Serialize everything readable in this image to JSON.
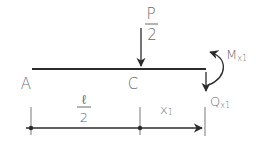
{
  "diagram": {
    "type": "beam free-body section",
    "colors": {
      "line": "#2b2b2b",
      "text": "#6a6a6a",
      "background": "#ffffff"
    },
    "points": {
      "a": "A",
      "c": "C"
    },
    "load": {
      "numerator": "P",
      "denominator": "2"
    },
    "moment": {
      "symbol": "M",
      "subscript": "x1"
    },
    "shear": {
      "symbol": "Q",
      "subscript": "x1"
    },
    "dimensions": {
      "half_span_numerator": "ℓ",
      "half_span_denominator": "2",
      "x_symbol": "x",
      "x_subscript": "1"
    }
  }
}
